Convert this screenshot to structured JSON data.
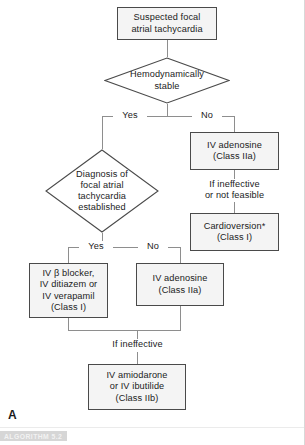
{
  "panel": {
    "letter": "A",
    "banner": "ALGORITHM 5.2"
  },
  "nodes": {
    "start": {
      "type": "process",
      "line1": "Suspected focal",
      "line2": "atrial tachycardia"
    },
    "decision_stable": {
      "type": "decision",
      "line1": "Hemodynamically",
      "line2": "stable"
    },
    "iv_adenosine_unstable": {
      "type": "process",
      "line1": "IV adenosine",
      "line2": "(Class IIa)"
    },
    "cardioversion": {
      "type": "process",
      "line1": "Cardioversion*",
      "line2": "(Class I)"
    },
    "decision_diagnosis": {
      "type": "decision",
      "line1": "Diagnosis of",
      "line2": "focal atrial",
      "line3": "tachycardia",
      "line4": "established"
    },
    "rate_control": {
      "type": "process",
      "line1": "IV β blocker,",
      "line2": "IV ditiazem or",
      "line3": "IV verapamil",
      "line4": "(Class I)"
    },
    "iv_adenosine_dx": {
      "type": "process",
      "line1": "IV adenosine",
      "line2": "(Class IIa)"
    },
    "amiodarone": {
      "type": "process",
      "line1": "IV amiodarone",
      "line2": "or IV ibutilide",
      "line3": "(Class IIb)"
    }
  },
  "edge_labels": {
    "stable_yes": "Yes",
    "stable_no": "No",
    "if_ineffective_or_not_feasible_1": "If ineffective",
    "if_ineffective_or_not_feasible_2": "or not feasible",
    "diagnosis_yes": "Yes",
    "diagnosis_no": "No",
    "if_ineffective": "If ineffective"
  },
  "colors": {
    "box_fill": "#f4f4f4",
    "box_border": "#4a4a4a",
    "connector": "#8e8e8e",
    "text": "#1b1b1b",
    "banner_bg": "#d6d6d6",
    "page_bg": "#ffffff"
  }
}
